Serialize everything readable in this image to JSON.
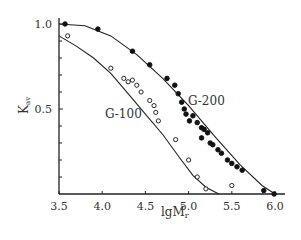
{
  "chart_data": {
    "type": "scatter",
    "title": "",
    "xlabel": "lgMr",
    "ylabel": "Kav",
    "xlim": [
      3.5,
      6.05
    ],
    "ylim": [
      0,
      1.05
    ],
    "x_ticks": [
      "3.5",
      "4.0",
      "4.5",
      "5.0",
      "5.5",
      "6.0"
    ],
    "y_ticks": [
      "0.5",
      "1.0"
    ],
    "grid": false,
    "series": [
      {
        "name": "G-200",
        "marker": "filled-circle",
        "points": [
          [
            3.57,
            1.0
          ],
          [
            3.95,
            0.97
          ],
          [
            4.35,
            0.84
          ],
          [
            4.55,
            0.76
          ],
          [
            4.75,
            0.68
          ],
          [
            4.84,
            0.64
          ],
          [
            4.88,
            0.59
          ],
          [
            4.92,
            0.54
          ],
          [
            4.95,
            0.5
          ],
          [
            4.97,
            0.47
          ],
          [
            5.01,
            0.43
          ],
          [
            5.05,
            0.46
          ],
          [
            5.1,
            0.42
          ],
          [
            5.15,
            0.39
          ],
          [
            5.22,
            0.36
          ],
          [
            5.18,
            0.38
          ],
          [
            5.15,
            0.33
          ],
          [
            5.25,
            0.3
          ],
          [
            5.28,
            0.29
          ],
          [
            5.34,
            0.26
          ],
          [
            5.38,
            0.24
          ],
          [
            5.45,
            0.2
          ],
          [
            5.5,
            0.18
          ],
          [
            5.56,
            0.16
          ],
          [
            5.62,
            0.14
          ],
          [
            5.87,
            0.02
          ],
          [
            5.99,
            0.0
          ]
        ],
        "curve": [
          [
            3.5,
            1.0
          ],
          [
            3.8,
            0.99
          ],
          [
            4.1,
            0.93
          ],
          [
            4.4,
            0.82
          ],
          [
            4.7,
            0.68
          ],
          [
            5.0,
            0.52
          ],
          [
            5.3,
            0.34
          ],
          [
            5.6,
            0.17
          ],
          [
            5.85,
            0.05
          ],
          [
            6.0,
            0.0
          ]
        ]
      },
      {
        "name": "G-100",
        "marker": "open-circle",
        "points": [
          [
            3.6,
            0.93
          ],
          [
            4.1,
            0.74
          ],
          [
            4.25,
            0.68
          ],
          [
            4.3,
            0.66
          ],
          [
            4.35,
            0.67
          ],
          [
            4.4,
            0.64
          ],
          [
            4.45,
            0.6
          ],
          [
            4.55,
            0.55
          ],
          [
            4.6,
            0.52
          ],
          [
            4.62,
            0.48
          ],
          [
            4.65,
            0.43
          ],
          [
            4.85,
            0.32
          ],
          [
            5.0,
            0.2
          ],
          [
            5.1,
            0.1
          ],
          [
            5.2,
            0.03
          ],
          [
            5.5,
            0.05
          ]
        ],
        "curve": [
          [
            3.5,
            0.93
          ],
          [
            3.7,
            0.87
          ],
          [
            3.9,
            0.8
          ],
          [
            4.1,
            0.71
          ],
          [
            4.3,
            0.59
          ],
          [
            4.5,
            0.47
          ],
          [
            4.7,
            0.35
          ],
          [
            4.9,
            0.21
          ],
          [
            5.05,
            0.11
          ],
          [
            5.2,
            0.04
          ],
          [
            5.35,
            0.0
          ]
        ]
      }
    ],
    "annotations": [
      "G-200",
      "G-100"
    ]
  },
  "labels": {
    "xlabel_main": "lgM",
    "xlabel_sub": "r",
    "ylabel_main": "K",
    "ylabel_sub": "av",
    "g200": "G-200",
    "g100": "G-100"
  }
}
